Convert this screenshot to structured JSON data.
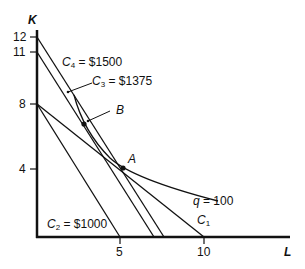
{
  "diagram": {
    "type": "isoquant-isocost",
    "axes": {
      "y_label": "K",
      "x_label": "L",
      "y_ticks": [
        "12",
        "11",
        "8",
        "4"
      ],
      "x_ticks": [
        "5",
        "10"
      ]
    },
    "isocost_lines": [
      {
        "id": "C1",
        "label": "C",
        "sub": "1",
        "value_text": "",
        "K_intercept": 8,
        "L_intercept": 10
      },
      {
        "id": "C2",
        "label": "C",
        "sub": "2",
        "value_text": " = $1000",
        "K_intercept": 8,
        "L_intercept": 5
      },
      {
        "id": "C3",
        "label": "C",
        "sub": "3",
        "value_text": " = $1375",
        "K_intercept": 11,
        "L_intercept": 7
      },
      {
        "id": "C4",
        "label": "C",
        "sub": "4",
        "value_text": " = $1500",
        "K_intercept": 12,
        "L_intercept": 7.6
      }
    ],
    "isoquant": {
      "label_var": "q",
      "label_value": " = 100"
    },
    "points": [
      {
        "id": "A",
        "label": "A",
        "L": 5.2,
        "K": 4.1
      },
      {
        "id": "B",
        "label": "B",
        "L": 2.8,
        "K": 6.8
      }
    ]
  }
}
